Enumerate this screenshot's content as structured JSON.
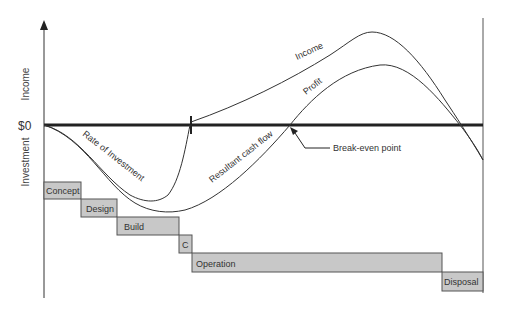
{
  "axes": {
    "y_upper_label": "Income",
    "y_lower_label": "Investment",
    "zero_label": "$0"
  },
  "curves": {
    "income": "Income",
    "profit": "Profit",
    "rate_of_investment": "Rate of Investment",
    "resultant_cash_flow": "Resultant cash flow"
  },
  "annotation": {
    "break_even": "Break-even point"
  },
  "phases": [
    {
      "label": "Concept",
      "x": 44,
      "y": 182,
      "w": 37,
      "h": 17
    },
    {
      "label": "Design",
      "x": 81,
      "y": 199,
      "w": 36,
      "h": 18
    },
    {
      "label": "Build",
      "x": 117,
      "y": 217,
      "w": 62,
      "h": 18
    },
    {
      "label": "C",
      "x": 179,
      "y": 235,
      "w": 13,
      "h": 18
    },
    {
      "label": "Operation",
      "x": 192,
      "y": 253,
      "w": 250,
      "h": 19
    },
    {
      "label": "Disposal",
      "x": 442,
      "y": 272,
      "w": 41,
      "h": 19
    }
  ],
  "colors": {
    "phase_fill": "#c8c8c8",
    "line": "#333333",
    "zero_line": "#222222"
  }
}
